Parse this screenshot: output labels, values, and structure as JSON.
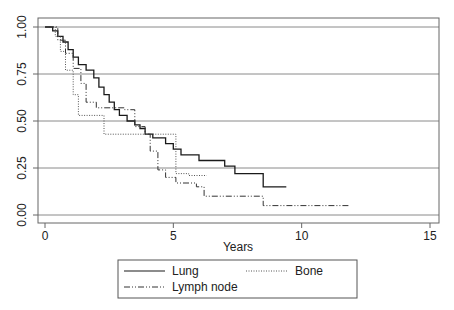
{
  "chart_data": {
    "type": "line",
    "subtype": "kaplan-meier-step",
    "title": "",
    "xlabel": "Years",
    "ylabel": "",
    "xlim": [
      0,
      15
    ],
    "ylim": [
      0,
      1
    ],
    "x_ticks": [
      "0",
      "5",
      "10",
      "15"
    ],
    "y_ticks": [
      "0.00",
      "0.25",
      "0.50",
      "0.75",
      "1.00"
    ],
    "grid": "horizontal",
    "legend_position": "bottom",
    "series": [
      {
        "name": "Lung",
        "style": "solid",
        "color": "#1a1a1a",
        "points": [
          [
            0,
            1.0
          ],
          [
            0.3,
            1.0
          ],
          [
            0.3,
            0.98
          ],
          [
            0.5,
            0.98
          ],
          [
            0.5,
            0.95
          ],
          [
            0.7,
            0.95
          ],
          [
            0.7,
            0.92
          ],
          [
            0.9,
            0.92
          ],
          [
            0.9,
            0.88
          ],
          [
            1.1,
            0.88
          ],
          [
            1.1,
            0.84
          ],
          [
            1.3,
            0.84
          ],
          [
            1.3,
            0.8
          ],
          [
            1.6,
            0.8
          ],
          [
            1.6,
            0.77
          ],
          [
            1.9,
            0.77
          ],
          [
            1.9,
            0.73
          ],
          [
            2.1,
            0.73
          ],
          [
            2.1,
            0.68
          ],
          [
            2.3,
            0.68
          ],
          [
            2.3,
            0.64
          ],
          [
            2.5,
            0.64
          ],
          [
            2.5,
            0.6
          ],
          [
            2.7,
            0.6
          ],
          [
            2.7,
            0.56
          ],
          [
            2.9,
            0.56
          ],
          [
            2.9,
            0.53
          ],
          [
            3.2,
            0.53
          ],
          [
            3.2,
            0.5
          ],
          [
            3.5,
            0.5
          ],
          [
            3.5,
            0.48
          ],
          [
            3.7,
            0.48
          ],
          [
            3.7,
            0.46
          ],
          [
            3.9,
            0.46
          ],
          [
            3.9,
            0.43
          ],
          [
            4.2,
            0.43
          ],
          [
            4.2,
            0.41
          ],
          [
            4.7,
            0.41
          ],
          [
            4.7,
            0.38
          ],
          [
            5.0,
            0.38
          ],
          [
            5.0,
            0.35
          ],
          [
            5.3,
            0.35
          ],
          [
            5.3,
            0.32
          ],
          [
            6.0,
            0.32
          ],
          [
            6.0,
            0.29
          ],
          [
            7.0,
            0.29
          ],
          [
            7.0,
            0.26
          ],
          [
            7.4,
            0.26
          ],
          [
            7.4,
            0.22
          ],
          [
            8.5,
            0.22
          ],
          [
            8.5,
            0.15
          ],
          [
            9.4,
            0.15
          ]
        ]
      },
      {
        "name": "Bone",
        "style": "dotted",
        "color": "#555555",
        "points": [
          [
            0,
            1.0
          ],
          [
            0.4,
            1.0
          ],
          [
            0.4,
            0.95
          ],
          [
            0.6,
            0.95
          ],
          [
            0.6,
            0.87
          ],
          [
            0.8,
            0.87
          ],
          [
            0.8,
            0.77
          ],
          [
            1.1,
            0.77
          ],
          [
            1.1,
            0.64
          ],
          [
            1.3,
            0.64
          ],
          [
            1.3,
            0.53
          ],
          [
            2.3,
            0.53
          ],
          [
            2.3,
            0.43
          ],
          [
            5.1,
            0.43
          ],
          [
            5.1,
            0.22
          ],
          [
            5.6,
            0.22
          ],
          [
            5.6,
            0.21
          ],
          [
            6.3,
            0.21
          ]
        ]
      },
      {
        "name": "Lymph node",
        "style": "dash-dot",
        "color": "#333333",
        "points": [
          [
            0,
            1.0
          ],
          [
            0.5,
            1.0
          ],
          [
            0.5,
            0.93
          ],
          [
            0.8,
            0.93
          ],
          [
            0.8,
            0.86
          ],
          [
            1.1,
            0.86
          ],
          [
            1.1,
            0.78
          ],
          [
            1.4,
            0.78
          ],
          [
            1.4,
            0.7
          ],
          [
            1.6,
            0.7
          ],
          [
            1.6,
            0.6
          ],
          [
            2.0,
            0.6
          ],
          [
            2.0,
            0.57
          ],
          [
            3.1,
            0.57
          ],
          [
            3.1,
            0.56
          ],
          [
            3.5,
            0.56
          ],
          [
            3.5,
            0.47
          ],
          [
            3.9,
            0.47
          ],
          [
            3.9,
            0.43
          ],
          [
            4.1,
            0.43
          ],
          [
            4.1,
            0.34
          ],
          [
            4.4,
            0.34
          ],
          [
            4.4,
            0.24
          ],
          [
            4.7,
            0.24
          ],
          [
            4.7,
            0.2
          ],
          [
            5.1,
            0.2
          ],
          [
            5.1,
            0.17
          ],
          [
            5.9,
            0.17
          ],
          [
            5.9,
            0.15
          ],
          [
            6.2,
            0.15
          ],
          [
            6.2,
            0.1
          ],
          [
            8.5,
            0.1
          ],
          [
            8.5,
            0.05
          ],
          [
            11.9,
            0.05
          ]
        ]
      }
    ]
  },
  "legend": {
    "items": [
      {
        "label": "Lung",
        "style": "solid"
      },
      {
        "label": "Bone",
        "style": "dotted"
      },
      {
        "label": "Lymph node",
        "style": "dash-dot"
      }
    ]
  }
}
